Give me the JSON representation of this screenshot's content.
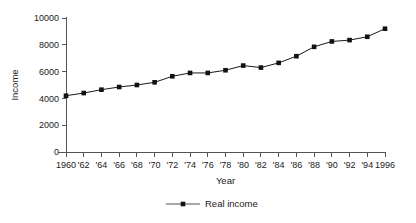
{
  "chart_data": {
    "type": "line",
    "title": "",
    "xlabel": "Year",
    "ylabel": "Income",
    "x": [
      1960,
      1962,
      1964,
      1966,
      1968,
      1970,
      1972,
      1974,
      1976,
      1978,
      1980,
      1982,
      1984,
      1986,
      1988,
      1990,
      1992,
      1994,
      1996
    ],
    "xtick_labels": [
      "1960",
      "'62",
      "'64",
      "'66",
      "'68",
      "'70",
      "'72",
      "'74",
      "'76",
      "'78",
      "'80",
      "'82",
      "'84",
      "'86",
      "'88",
      "'90",
      "'92",
      "'94",
      "1996"
    ],
    "ytick_labels": [
      "0",
      "2000",
      "4000",
      "6000",
      "8000",
      "10000"
    ],
    "yticks": [
      0,
      2000,
      4000,
      6000,
      8000,
      10000
    ],
    "ylim": [
      0,
      10000
    ],
    "xlim": [
      1960,
      1996
    ],
    "grid": false,
    "legend_position": "bottom-center",
    "series": [
      {
        "name": "Real income",
        "color": "#111111",
        "marker": "square",
        "values": [
          4200,
          4400,
          4650,
          4850,
          5000,
          5200,
          5650,
          5900,
          5900,
          6100,
          6450,
          6300,
          6650,
          7150,
          7850,
          8250,
          8350,
          8600,
          9200
        ]
      }
    ]
  },
  "legend": {
    "entries": [
      {
        "label": "Real income"
      }
    ]
  }
}
